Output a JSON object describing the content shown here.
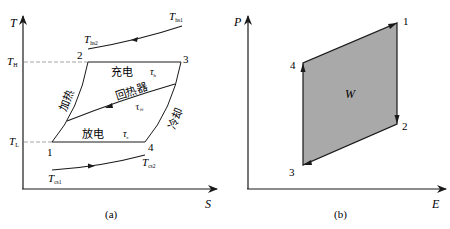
{
  "panel_a": {
    "caption": "(a)",
    "y_axis_label": "T",
    "x_axis_label": "S",
    "levels": {
      "high": {
        "main": "T",
        "sub": "H"
      },
      "low": {
        "main": "T",
        "sub": "L"
      }
    },
    "points": [
      "1",
      "2",
      "3",
      "4"
    ],
    "hot_stream": {
      "start": {
        "main": "T",
        "sub": "hs1"
      },
      "end": {
        "main": "T",
        "sub": "hs2"
      }
    },
    "cold_stream": {
      "start": {
        "main": "T",
        "sub": "cs1"
      },
      "end": {
        "main": "T",
        "sub": "cs2"
      }
    },
    "processes": {
      "charge": "充电",
      "discharge": "放电",
      "heating": "加热",
      "cooling": "冷却",
      "regenerator": "回热器"
    },
    "ratios": {
      "charge": {
        "main": "τ",
        "sub": "h"
      },
      "discharge": {
        "main": "τ",
        "sub": "c"
      },
      "regenerator": {
        "main": "τ",
        "sub": "re"
      }
    }
  },
  "panel_b": {
    "caption": "(b)",
    "y_axis_label": "P",
    "x_axis_label": "E",
    "points": [
      "1",
      "2",
      "3",
      "4"
    ],
    "area_label": "W",
    "fill_color": "#a9a9a9"
  },
  "colors": {
    "line": "#1a1a1a",
    "dashed": "#9a9a9a"
  }
}
